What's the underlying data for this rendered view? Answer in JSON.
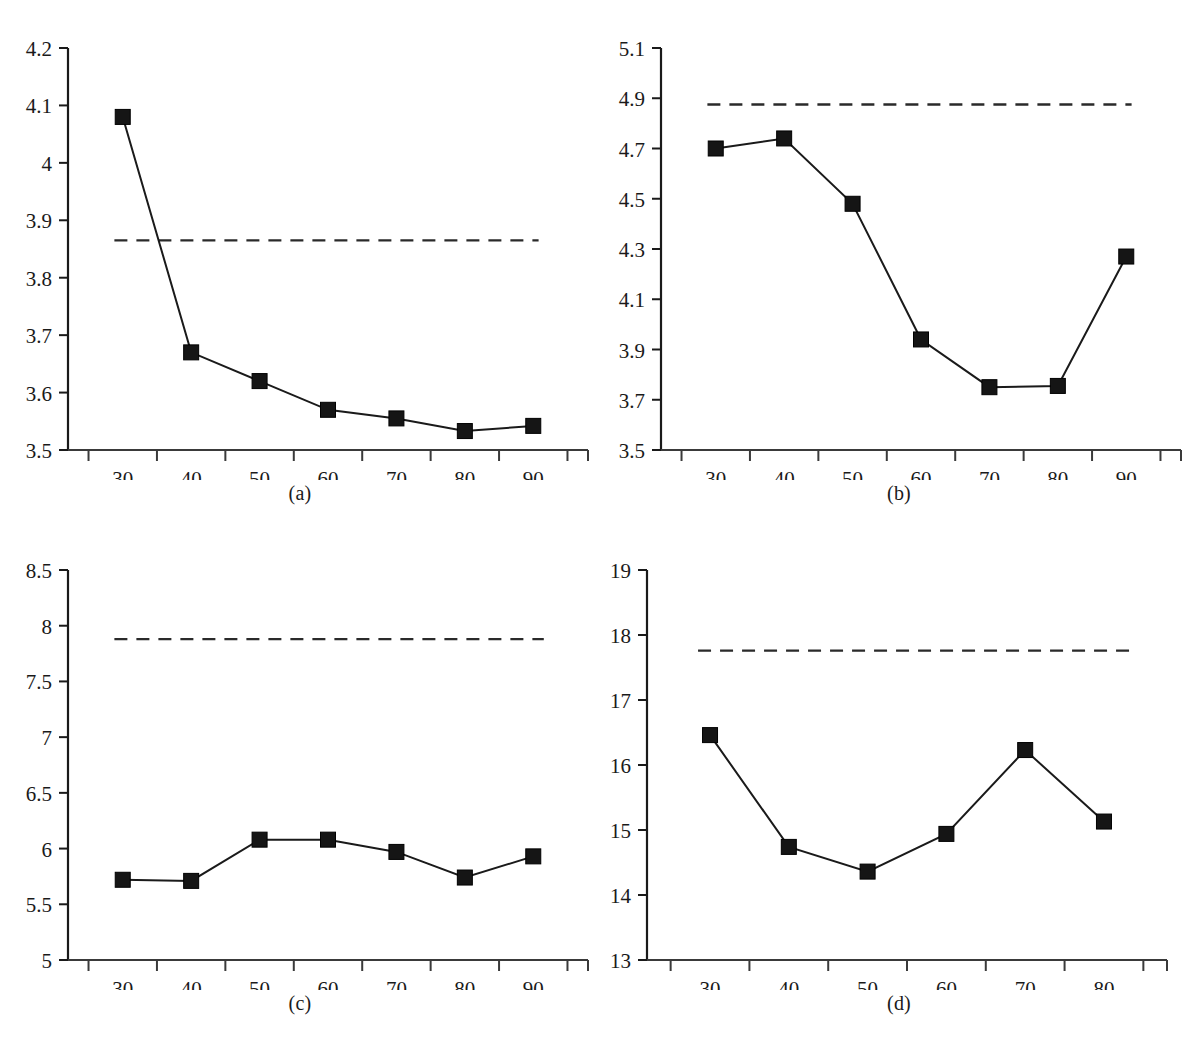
{
  "figure": {
    "type": "multi-panel-line-chart",
    "panel_count": 4,
    "background_color": "#ffffff",
    "line_color": "#1a1a1a",
    "marker_color": "#1a1a1a",
    "marker_shape": "filled-square",
    "reference_line_style": "dashed"
  },
  "captions": {
    "a": "(a)",
    "b": "(b)",
    "c": "(c)",
    "d": "(d)"
  },
  "chart_data": [
    {
      "id": "a",
      "type": "line",
      "title": "(a)",
      "xlabel": "",
      "ylabel": "",
      "categories": [
        "30",
        "40",
        "50",
        "60",
        "70",
        "80",
        "90"
      ],
      "x": [
        30,
        40,
        50,
        60,
        70,
        80,
        90
      ],
      "values": [
        4.08,
        3.67,
        3.62,
        3.57,
        3.555,
        3.533,
        3.542
      ],
      "series": [
        {
          "name": "proposed",
          "values": [
            4.08,
            3.67,
            3.62,
            3.57,
            3.555,
            3.533,
            3.542
          ],
          "marker": "filled-square",
          "line": "solid"
        }
      ],
      "reference_line": {
        "value": 3.865,
        "style": "dashed",
        "label": ""
      },
      "ylim": [
        3.5,
        4.2
      ],
      "ytick_labels": [
        "3.5",
        "3.6",
        "3.7",
        "3.8",
        "3.9",
        "4",
        "4.1",
        "4.2"
      ],
      "ytick_values": [
        3.5,
        3.6,
        3.7,
        3.8,
        3.9,
        4.0,
        4.1,
        4.2
      ],
      "xtick_labels": [
        "30",
        "40",
        "50",
        "60",
        "70",
        "80",
        "90"
      ],
      "grid": false,
      "legend": "none"
    },
    {
      "id": "b",
      "type": "line",
      "title": "(b)",
      "xlabel": "",
      "ylabel": "",
      "categories": [
        "30",
        "40",
        "50",
        "60",
        "70",
        "80",
        "90"
      ],
      "x": [
        30,
        40,
        50,
        60,
        70,
        80,
        90
      ],
      "values": [
        4.7,
        4.74,
        4.48,
        3.94,
        3.75,
        3.755,
        4.27
      ],
      "series": [
        {
          "name": "proposed",
          "values": [
            4.7,
            4.74,
            4.48,
            3.94,
            3.75,
            3.755,
            4.27
          ],
          "marker": "filled-square",
          "line": "solid"
        }
      ],
      "reference_line": {
        "value": 4.875,
        "style": "dashed",
        "label": ""
      },
      "ylim": [
        3.5,
        5.1
      ],
      "ytick_labels": [
        "3.5",
        "3.7",
        "3.9",
        "4.1",
        "4.3",
        "4.5",
        "4.7",
        "4.9",
        "5.1"
      ],
      "ytick_values": [
        3.5,
        3.7,
        3.9,
        4.1,
        4.3,
        4.5,
        4.7,
        4.9,
        5.1
      ],
      "xtick_labels": [
        "30",
        "40",
        "50",
        "60",
        "70",
        "80",
        "90"
      ],
      "grid": false,
      "legend": "none"
    },
    {
      "id": "c",
      "type": "line",
      "title": "(c)",
      "xlabel": "",
      "ylabel": "",
      "categories": [
        "30",
        "40",
        "50",
        "60",
        "70",
        "80",
        "90"
      ],
      "x": [
        30,
        40,
        50,
        60,
        70,
        80,
        90
      ],
      "values": [
        5.72,
        5.71,
        6.08,
        6.08,
        5.97,
        5.74,
        5.93
      ],
      "series": [
        {
          "name": "proposed",
          "values": [
            5.72,
            5.71,
            6.08,
            6.08,
            5.97,
            5.74,
            5.93
          ],
          "marker": "filled-square",
          "line": "solid"
        }
      ],
      "reference_line": {
        "value": 7.88,
        "style": "dashed",
        "label": ""
      },
      "ylim": [
        5,
        8.5
      ],
      "ytick_labels": [
        "5",
        "5.5",
        "6",
        "6.5",
        "7",
        "7.5",
        "8",
        "8.5"
      ],
      "ytick_values": [
        5,
        5.5,
        6,
        6.5,
        7,
        7.5,
        8,
        8.5
      ],
      "xtick_labels": [
        "30",
        "40",
        "50",
        "60",
        "70",
        "80",
        "90"
      ],
      "grid": false,
      "legend": "none"
    },
    {
      "id": "d",
      "type": "line",
      "title": "(d)",
      "xlabel": "",
      "ylabel": "",
      "categories": [
        "30",
        "40",
        "50",
        "60",
        "70",
        "80"
      ],
      "x": [
        30,
        40,
        50,
        60,
        70,
        80
      ],
      "values": [
        16.46,
        14.74,
        14.36,
        14.94,
        16.23,
        15.13
      ],
      "series": [
        {
          "name": "proposed",
          "values": [
            16.46,
            14.74,
            14.36,
            14.94,
            16.23,
            15.13
          ],
          "marker": "filled-square",
          "line": "solid"
        }
      ],
      "reference_line": {
        "value": 17.76,
        "style": "dashed",
        "label": ""
      },
      "ylim": [
        13,
        19
      ],
      "ytick_labels": [
        "13",
        "14",
        "15",
        "16",
        "17",
        "18",
        "19"
      ],
      "ytick_values": [
        13,
        14,
        15,
        16,
        17,
        18,
        19
      ],
      "xtick_labels": [
        "30",
        "40",
        "50",
        "60",
        "70",
        "80"
      ],
      "grid": false,
      "legend": "none"
    }
  ]
}
